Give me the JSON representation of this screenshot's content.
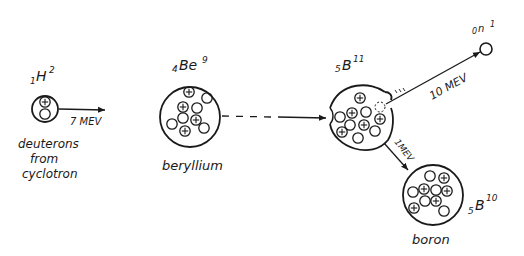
{
  "diagram": {
    "type": "nuclear-reaction",
    "colors": {
      "ink": "#1a1a1a",
      "background": "#ffffff"
    },
    "deuteron": {
      "symbol_sub": "1",
      "symbol": "H",
      "symbol_sup": "2",
      "energy": "7 MEV",
      "caption_lines": [
        "deuterons",
        "from",
        "cyclotron"
      ]
    },
    "beryllium": {
      "symbol_sub": "4",
      "symbol": "Be",
      "symbol_sup": "9",
      "caption": "beryllium"
    },
    "compound": {
      "symbol_sub": "5",
      "symbol": "B",
      "symbol_sup": "11"
    },
    "neutron": {
      "symbol_sub": "0",
      "symbol": "n",
      "symbol_sup": "1",
      "energy": "10 MEV"
    },
    "boron10": {
      "symbol_sub": "5",
      "symbol": "B",
      "symbol_sup": "10",
      "energy": "1MEV",
      "caption": "boron"
    }
  }
}
